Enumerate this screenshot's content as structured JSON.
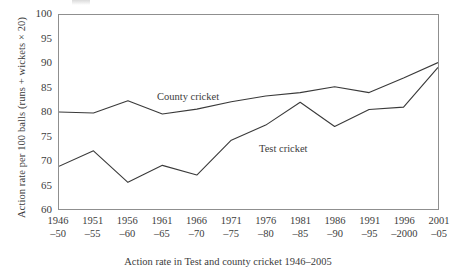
{
  "figure": {
    "caption": "Action rate in Test and county cricket 1946–2005",
    "y_axis_title": "Action rate per 100 balls (runs + wickets × 20)",
    "line_color": "#3a3a3a",
    "frame_color": "#8f8f8f",
    "text_color": "#3c3c3c",
    "background": "#ffffff"
  },
  "chart_data": {
    "type": "line",
    "title": "",
    "subtitle": "",
    "xlabel": "Action rate in Test and county cricket 1946–2005",
    "ylabel": "Action rate per 100 balls (runs + wickets × 20)",
    "categories": [
      "1946–50",
      "1951–55",
      "1956–60",
      "1961–65",
      "1966–70",
      "1971–75",
      "1976–80",
      "1981–85",
      "1986–90",
      "1991–95",
      "1996–2000",
      "2001–05"
    ],
    "category_lines": [
      [
        "1946",
        "–50"
      ],
      [
        "1951",
        "–55"
      ],
      [
        "1956",
        "–60"
      ],
      [
        "1961",
        "–65"
      ],
      [
        "1966",
        "–70"
      ],
      [
        "1971",
        "–75"
      ],
      [
        "1976",
        "–80"
      ],
      [
        "1981",
        "–85"
      ],
      [
        "1986",
        "–90"
      ],
      [
        "1991",
        "–95"
      ],
      [
        "1996",
        "–2000"
      ],
      [
        "2001",
        "–05"
      ]
    ],
    "series": [
      {
        "name": "County cricket",
        "values": [
          80.0,
          79.8,
          82.3,
          79.6,
          80.6,
          82.1,
          83.3,
          84.0,
          85.2,
          84.0,
          87.0,
          90.2
        ]
      },
      {
        "name": "Test cricket",
        "values": [
          68.8,
          72.0,
          65.5,
          69.0,
          67.0,
          74.2,
          77.3,
          82.0,
          77.0,
          80.5,
          81.0,
          89.2
        ]
      }
    ],
    "yticks": [
      60,
      65,
      70,
      75,
      80,
      85,
      90,
      95,
      100
    ],
    "ylim": [
      60,
      100
    ],
    "xlim": [
      0,
      11
    ],
    "grid": false,
    "legend": "inline-annotations",
    "annotations": [
      {
        "text": "County cricket",
        "series": "County cricket"
      },
      {
        "text": "Test cricket",
        "series": "Test cricket"
      }
    ]
  }
}
